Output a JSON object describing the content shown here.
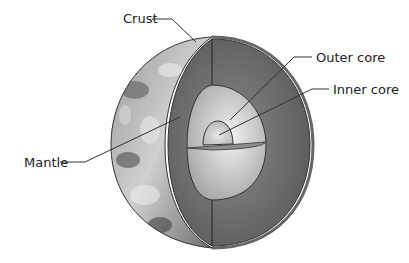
{
  "diagram": {
    "labels": {
      "crust": "Crust",
      "outer_core": "Outer core",
      "inner_core": "Inner core",
      "mantle": "Mantle"
    }
  }
}
